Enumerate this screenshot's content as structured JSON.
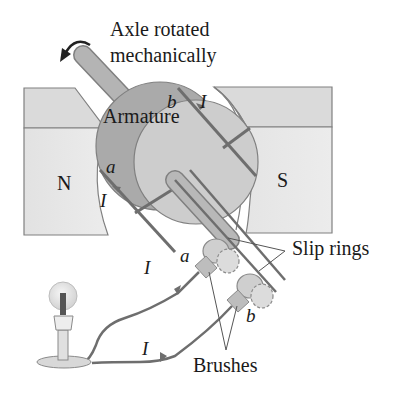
{
  "diagram": {
    "title_lines": [
      "Axle rotated",
      "mechanically"
    ],
    "labels": {
      "armature": "Armature",
      "north_pole": "N",
      "south_pole": "S",
      "slip_rings": "Slip rings",
      "brushes": "Brushes",
      "coil_end_a": "a",
      "coil_end_b": "b",
      "brush_a": "a",
      "brush_b": "b",
      "current_coil_top": "I",
      "current_coil_left": "I",
      "current_wire_upper": "I",
      "current_wire_lower": "I"
    },
    "components": [
      "axle",
      "rotation-arrow",
      "north-pole",
      "south-pole",
      "armature",
      "coil",
      "slip-ring-a",
      "slip-ring-b",
      "brush-a",
      "brush-b",
      "wire-a",
      "wire-b",
      "light-bulb"
    ],
    "colors": {
      "pole_face": "#e4e4e4",
      "pole_top": "#d6d6d6",
      "armature_dark": "#a9a9a9",
      "armature_light": "#cdcdcd",
      "axle": "#b4b4b4",
      "wire": "#6e6e6e",
      "outline": "#777777"
    }
  }
}
